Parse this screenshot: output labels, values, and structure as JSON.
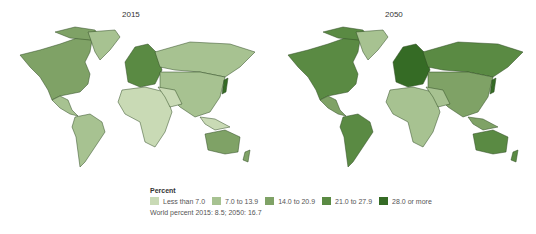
{
  "maps": [
    {
      "title": "2015"
    },
    {
      "title": "2050"
    }
  ],
  "legend": {
    "title": "Percent",
    "items": [
      {
        "label": "Less than 7.0",
        "color": "#c9dab5"
      },
      {
        "label": "7.0 to 13.9",
        "color": "#a7c291"
      },
      {
        "label": "14.0 to 20.9",
        "color": "#7fa266"
      },
      {
        "label": "21.0 to 27.9",
        "color": "#5a8a43"
      },
      {
        "label": "28.0 or more",
        "color": "#356b25"
      }
    ],
    "note": "World percent 2015: 8.5; 2050: 16.7"
  },
  "colors": {
    "border": "#2f4a22",
    "water": "#ffffff"
  }
}
